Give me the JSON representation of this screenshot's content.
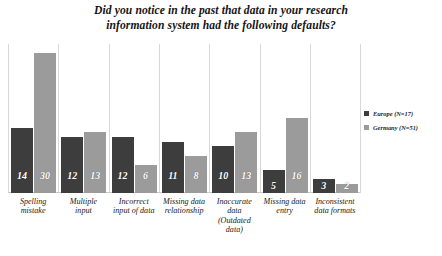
{
  "chart_data": {
    "type": "bar",
    "title": "Did you notice in the past that data in your research information system had the following defaults?",
    "title_lines": [
      "Did you notice in the past that data in your research",
      "information system had the following defaults?"
    ],
    "xlabel": "",
    "ylabel": "",
    "ylim": [
      0,
      32
    ],
    "grid": false,
    "legend_position": "right",
    "categories": [
      "Spelling mistake",
      "Multiple input",
      "Incorrect input of data",
      "Missing data relationship",
      "Inaccurate data (Outdated data)",
      "Missing data entry",
      "Inconsistent data formats"
    ],
    "category_lines": [
      [
        "Spelling",
        "mistake"
      ],
      [
        "Multiple",
        "input"
      ],
      [
        "Incorrect",
        "input of data"
      ],
      [
        "Missing data",
        "relationship"
      ],
      [
        "Inaccurate",
        "data",
        "(Outdated",
        "data)"
      ],
      [
        "Missing data",
        "entry"
      ],
      [
        "Inconsistent",
        "data formats"
      ]
    ],
    "series": [
      {
        "name": "Europe (N=17)",
        "color": "#3d3d3d",
        "values": [
          14,
          12,
          12,
          11,
          10,
          5,
          3
        ]
      },
      {
        "name": "Germany (N=51)",
        "color": "#9b9b9b",
        "values": [
          30,
          13,
          6,
          8,
          13,
          16,
          2
        ]
      }
    ]
  },
  "legend": {
    "items": [
      {
        "label": "Europe (N=17)",
        "color": "#3d3d3d"
      },
      {
        "label": "Germany (N=51)",
        "color": "#9b9b9b"
      }
    ]
  }
}
